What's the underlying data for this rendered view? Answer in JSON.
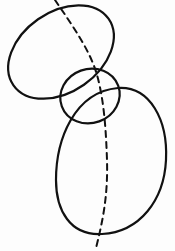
{
  "diagram": {
    "type": "line-drawing",
    "stroke_color": "#111111",
    "background_color": "#fdfdfd",
    "shapes": [
      {
        "id": "upper-oval",
        "kind": "ellipse",
        "cx": 61,
        "cy": 52,
        "rx": 58,
        "ry": 42,
        "rotate": -35
      },
      {
        "id": "middle-oval",
        "kind": "ellipse",
        "cx": 90,
        "cy": 96,
        "rx": 30,
        "ry": 27,
        "rotate": -20
      },
      {
        "id": "lower-oval",
        "kind": "ellipse",
        "cx": 112,
        "cy": 160,
        "rx": 56,
        "ry": 75,
        "rotate": 8
      }
    ],
    "axis": {
      "id": "dashed-axis",
      "kind": "dashed-curve",
      "dasharray": "6 5"
    }
  }
}
